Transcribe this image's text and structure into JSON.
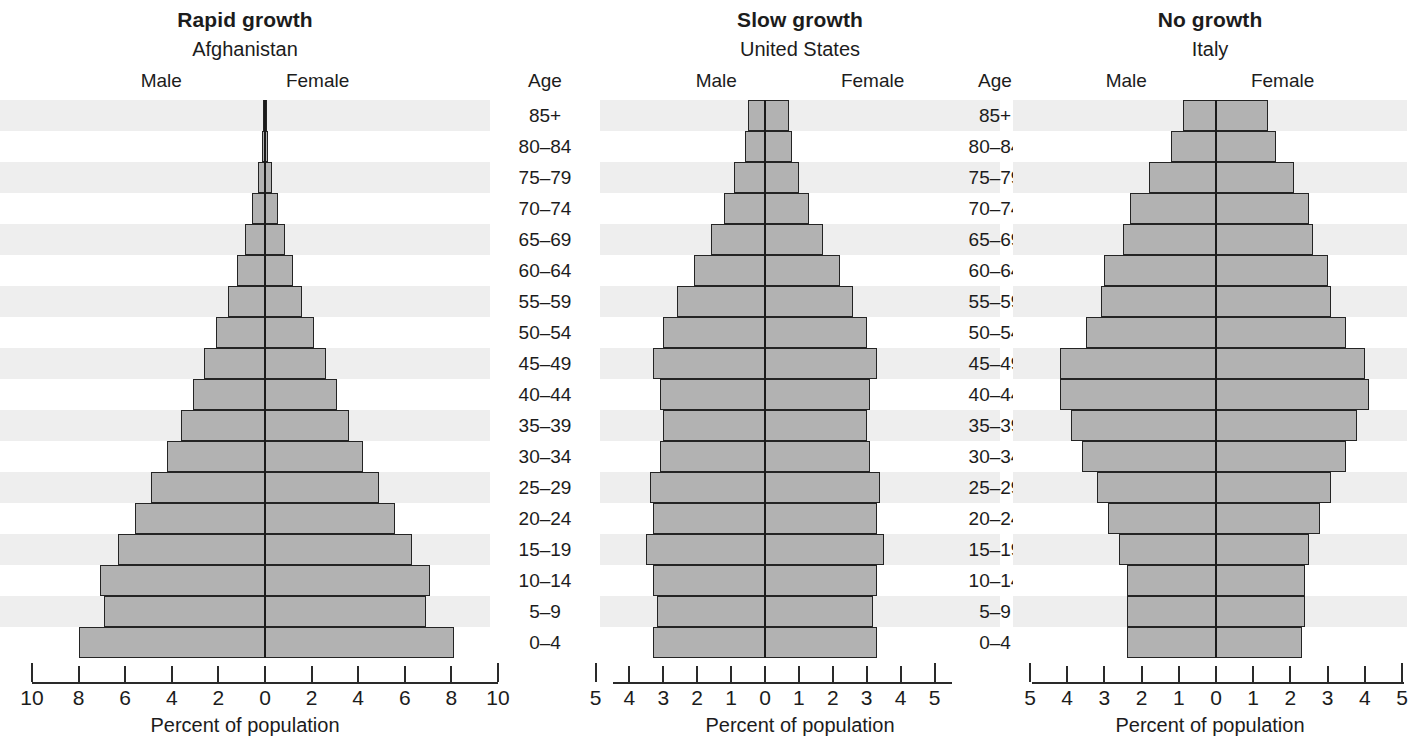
{
  "age_header": "Age",
  "age_groups": [
    "85+",
    "80–84",
    "75–79",
    "70–74",
    "65–69",
    "60–64",
    "55–59",
    "50–54",
    "45–49",
    "40–44",
    "35–39",
    "30–34",
    "25–29",
    "20–24",
    "15–19",
    "10–14",
    "5–9",
    "0–4"
  ],
  "sex_labels": {
    "male": "Male",
    "female": "Female"
  },
  "axis_caption": "Percent of population",
  "colors": {
    "bar_fill": "#b2b2b2",
    "bar_stroke": "#242424",
    "band": "#eeeeee",
    "axis": "#2a2a2a"
  },
  "chart_data": [
    {
      "type": "bar",
      "title": "Rapid growth",
      "subtitle": "Afghanistan",
      "country": "Afghanistan",
      "xlabel": "Percent of population",
      "ylabel": "Age",
      "xlim": [
        -10,
        10
      ],
      "xticks": [
        "10",
        "8",
        "6",
        "4",
        "2",
        "0",
        "2",
        "4",
        "6",
        "8",
        "10"
      ],
      "xtick_values": [
        -10,
        -8,
        -6,
        -4,
        -2,
        0,
        2,
        4,
        6,
        8,
        10
      ],
      "grid": false,
      "legend": [
        "Male",
        "Female"
      ],
      "categories": [
        "85+",
        "80–84",
        "75–79",
        "70–74",
        "65–69",
        "60–64",
        "55–59",
        "50–54",
        "45–49",
        "40–44",
        "35–39",
        "30–34",
        "25–29",
        "20–24",
        "15–19",
        "10–14",
        "5–9",
        "0–4"
      ],
      "series": [
        {
          "name": "Male",
          "values": [
            0.1,
            0.15,
            0.3,
            0.55,
            0.85,
            1.2,
            1.6,
            2.1,
            2.6,
            3.1,
            3.6,
            4.2,
            4.9,
            5.6,
            6.3,
            7.1,
            6.9,
            8.0
          ]
        },
        {
          "name": "Female",
          "values": [
            0.1,
            0.15,
            0.3,
            0.55,
            0.85,
            1.2,
            1.6,
            2.1,
            2.6,
            3.1,
            3.6,
            4.2,
            4.9,
            5.6,
            6.3,
            7.1,
            6.9,
            8.1
          ]
        }
      ]
    },
    {
      "type": "bar",
      "title": "Slow growth",
      "subtitle": "United States",
      "country": "United States",
      "xlabel": "Percent of population",
      "ylabel": "Age",
      "xlim": [
        -5,
        5
      ],
      "xticks": [
        "5",
        "4",
        "3",
        "2",
        "1",
        "0",
        "1",
        "2",
        "3",
        "4",
        "5"
      ],
      "xtick_values": [
        -5,
        -4,
        -3,
        -2,
        -1,
        0,
        1,
        2,
        3,
        4,
        5
      ],
      "grid": false,
      "legend": [
        "Male",
        "Female"
      ],
      "categories": [
        "85+",
        "80–84",
        "75–79",
        "70–74",
        "65–69",
        "60–64",
        "55–59",
        "50–54",
        "45–49",
        "40–44",
        "35–39",
        "30–34",
        "25–29",
        "20–24",
        "15–19",
        "10–14",
        "5–9",
        "0–4"
      ],
      "series": [
        {
          "name": "Male",
          "values": [
            0.5,
            0.6,
            0.9,
            1.2,
            1.6,
            2.1,
            2.6,
            3.0,
            3.3,
            3.1,
            3.0,
            3.1,
            3.4,
            3.3,
            3.5,
            3.3,
            3.2,
            3.3
          ]
        },
        {
          "name": "Female",
          "values": [
            0.7,
            0.8,
            1.0,
            1.3,
            1.7,
            2.2,
            2.6,
            3.0,
            3.3,
            3.1,
            3.0,
            3.1,
            3.4,
            3.3,
            3.5,
            3.3,
            3.2,
            3.3
          ]
        }
      ]
    },
    {
      "type": "bar",
      "title": "No growth",
      "subtitle": "Italy",
      "country": "Italy",
      "xlabel": "Percent of population",
      "ylabel": "Age",
      "xlim": [
        -5,
        5
      ],
      "xticks": [
        "5",
        "4",
        "3",
        "2",
        "1",
        "0",
        "1",
        "2",
        "3",
        "4",
        "5"
      ],
      "xtick_values": [
        -5,
        -4,
        -3,
        -2,
        -1,
        0,
        1,
        2,
        3,
        4,
        5
      ],
      "grid": false,
      "legend": [
        "Male",
        "Female"
      ],
      "categories": [
        "85+",
        "80–84",
        "75–79",
        "70–74",
        "65–69",
        "60–64",
        "55–59",
        "50–54",
        "45–49",
        "40–44",
        "35–39",
        "30–34",
        "25–29",
        "20–24",
        "15–19",
        "10–14",
        "5–9",
        "0–4"
      ],
      "series": [
        {
          "name": "Male",
          "values": [
            0.9,
            1.2,
            1.8,
            2.3,
            2.5,
            3.0,
            3.1,
            3.5,
            4.2,
            4.2,
            3.9,
            3.6,
            3.2,
            2.9,
            2.6,
            2.4,
            2.4,
            2.4
          ]
        },
        {
          "name": "Female",
          "values": [
            1.4,
            1.6,
            2.1,
            2.5,
            2.6,
            3.0,
            3.1,
            3.5,
            4.0,
            4.1,
            3.8,
            3.5,
            3.1,
            2.8,
            2.5,
            2.4,
            2.4,
            2.3
          ]
        }
      ]
    }
  ]
}
